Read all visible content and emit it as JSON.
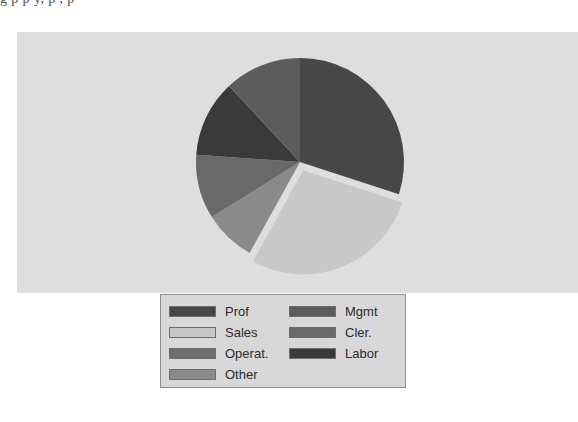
{
  "page": {
    "clipped_text_top": "g  p  p  y,                        p       ,      p"
  },
  "panel": {
    "background_color": "#dedede",
    "page_background_color": "#ffffff"
  },
  "legend": {
    "background_color": "#d8d8d8",
    "border_color": "#8e8e8e",
    "columns": [
      {
        "items": [
          {
            "label": "Prof",
            "color": "#474747"
          },
          {
            "label": "Sales",
            "color": "#c8c8c8"
          },
          {
            "label": "Operat.",
            "color": "#6e6e6e"
          },
          {
            "label": "Other",
            "color": "#8a8a8a"
          }
        ]
      },
      {
        "items": [
          {
            "label": "Mgmt",
            "color": "#5c5c5c"
          },
          {
            "label": "Cler.",
            "color": "#696969"
          },
          {
            "label": "Labor",
            "color": "#3a3a3a"
          }
        ]
      }
    ]
  },
  "chart_data": {
    "type": "pie",
    "title": "",
    "subtitle": "",
    "xlabel": "",
    "ylabel": "",
    "grid": false,
    "legend_position": "bottom",
    "start_angle_deg": 0,
    "direction": "clockwise",
    "exploded_slice": "Sales",
    "explode_offset_px": 9,
    "center": {
      "x": 283,
      "y": 130
    },
    "radius": 104,
    "categories": [
      "Prof",
      "Sales",
      "Other",
      "Cler.",
      "Labor",
      "Mgmt"
    ],
    "values": [
      30,
      28,
      8,
      10,
      12,
      12
    ],
    "unit": "percent",
    "slices": [
      {
        "label": "Prof",
        "value": 30,
        "color": "#474747",
        "start_deg": 0,
        "end_deg": 108,
        "exploded": false
      },
      {
        "label": "Sales",
        "value": 28,
        "color": "#c8c8c8",
        "start_deg": 108,
        "end_deg": 209,
        "exploded": true
      },
      {
        "label": "Other",
        "value": 8,
        "color": "#8a8a8a",
        "start_deg": 209,
        "end_deg": 238,
        "exploded": false
      },
      {
        "label": "Cler.",
        "value": 10,
        "color": "#696969",
        "start_deg": 238,
        "end_deg": 274,
        "exploded": false
      },
      {
        "label": "Labor",
        "value": 12,
        "color": "#3a3a3a",
        "start_deg": 274,
        "end_deg": 317,
        "exploded": false
      },
      {
        "label": "Mgmt",
        "value": 12,
        "color": "#5c5c5c",
        "start_deg": 317,
        "end_deg": 360,
        "exploded": false
      }
    ],
    "legend_entries": [
      "Prof",
      "Sales",
      "Operat.",
      "Other",
      "Mgmt",
      "Cler.",
      "Labor"
    ]
  }
}
